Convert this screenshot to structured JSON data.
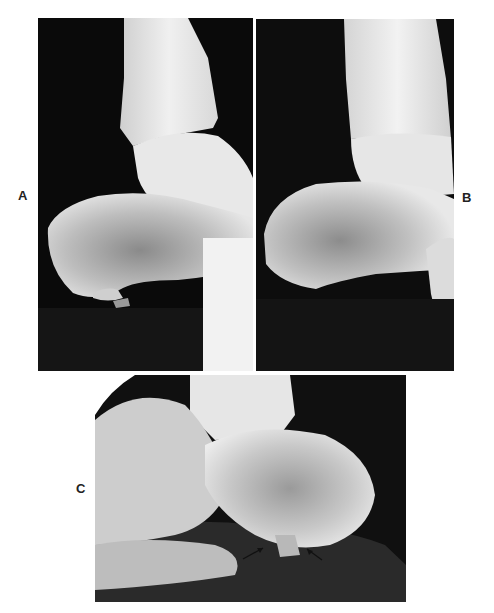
{
  "figure": {
    "panels": [
      {
        "id": "A",
        "label": "A",
        "description": "Lateral radiograph of ankle and calcaneus"
      },
      {
        "id": "B",
        "label": "B",
        "description": "Lateral radiograph of ankle and calcaneus"
      },
      {
        "id": "C",
        "label": "C",
        "description": "Lateral radiograph of hindfoot with arrows indicating plantar calcaneal region"
      }
    ],
    "annotations": {
      "arrow_count": 2
    }
  }
}
